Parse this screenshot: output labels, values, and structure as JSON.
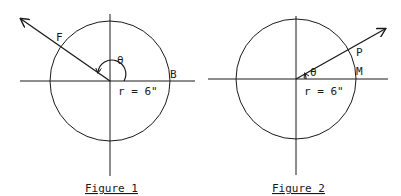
{
  "figures": [
    {
      "caption": "Figure 1",
      "center": [
        110,
        81
      ],
      "radius": 60,
      "angle_label": "θ",
      "radius_label": "r = 6\"",
      "points": [
        {
          "label": "F",
          "x": 55,
          "y": 41
        },
        {
          "label": "B",
          "x": 172,
          "y": 77
        }
      ],
      "arrow_end": [
        21,
        18
      ],
      "stroke_color": "#1a1a1a"
    },
    {
      "caption": "Figure 2",
      "center": [
        296,
        79
      ],
      "radius": 60,
      "angle_label": "θ",
      "radius_label": "r = 6\"",
      "points": [
        {
          "label": "P",
          "x": 356,
          "y": 56
        },
        {
          "label": "M",
          "x": 356,
          "y": 74
        }
      ],
      "arrow_end": [
        386,
        28
      ],
      "stroke_color": "#1a1a1a"
    }
  ]
}
